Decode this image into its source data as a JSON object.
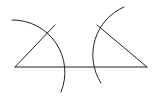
{
  "diagram": {
    "stroke_color": "#222222",
    "background": "#ffffff",
    "baseline": {
      "x1": 15,
      "y1": 67,
      "x2": 147,
      "y2": 67
    },
    "left_triangle": {
      "base_vertex": [
        15,
        67
      ],
      "apex": [
        55,
        25
      ]
    },
    "right_triangle": {
      "base_vertex": [
        147,
        67
      ],
      "apex": [
        97,
        25
      ]
    },
    "left_arc": {
      "d": "M12,20 A52,52 0 0 1 61,92"
    },
    "right_arc": {
      "d": "M124,7 A52,52 0 0 0 101,83"
    }
  }
}
